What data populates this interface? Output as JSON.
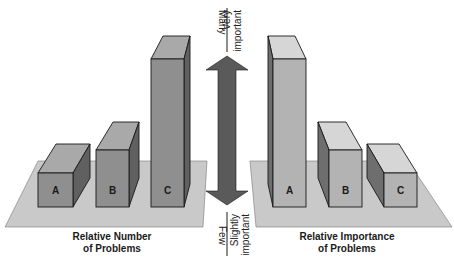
{
  "diagram": {
    "left_panel": {
      "caption_line1": "Relative Number",
      "caption_line2": "of Problems",
      "bars": [
        {
          "label": "A",
          "relative_height": "low"
        },
        {
          "label": "B",
          "relative_height": "medium"
        },
        {
          "label": "C",
          "relative_height": "high"
        }
      ]
    },
    "right_panel": {
      "caption_line1": "Relative Importance",
      "caption_line2": "of Problems",
      "bars": [
        {
          "label": "A",
          "relative_height": "high"
        },
        {
          "label": "B",
          "relative_height": "medium"
        },
        {
          "label": "C",
          "relative_height": "low"
        }
      ]
    },
    "scale": {
      "top_left": "Many",
      "top_right_line1": "Very",
      "top_right_line2": "important",
      "bottom_left": "Few",
      "bottom_right_line1": "Slightly",
      "bottom_right_line2": "important",
      "arrow": "double-headed-vertical-arrow"
    },
    "colors": {
      "platform": "#c9c9c9",
      "left_bar_front": "#8f8f8f",
      "left_bar_top": "#a9a9a9",
      "left_bar_side": "#606060",
      "right_bar_front": "#b3b3b3",
      "right_bar_top": "#d6d6d6",
      "right_bar_side": "#6e6e6e",
      "arrow": "#5a5a5a",
      "outline": "#1a1a1a"
    }
  }
}
